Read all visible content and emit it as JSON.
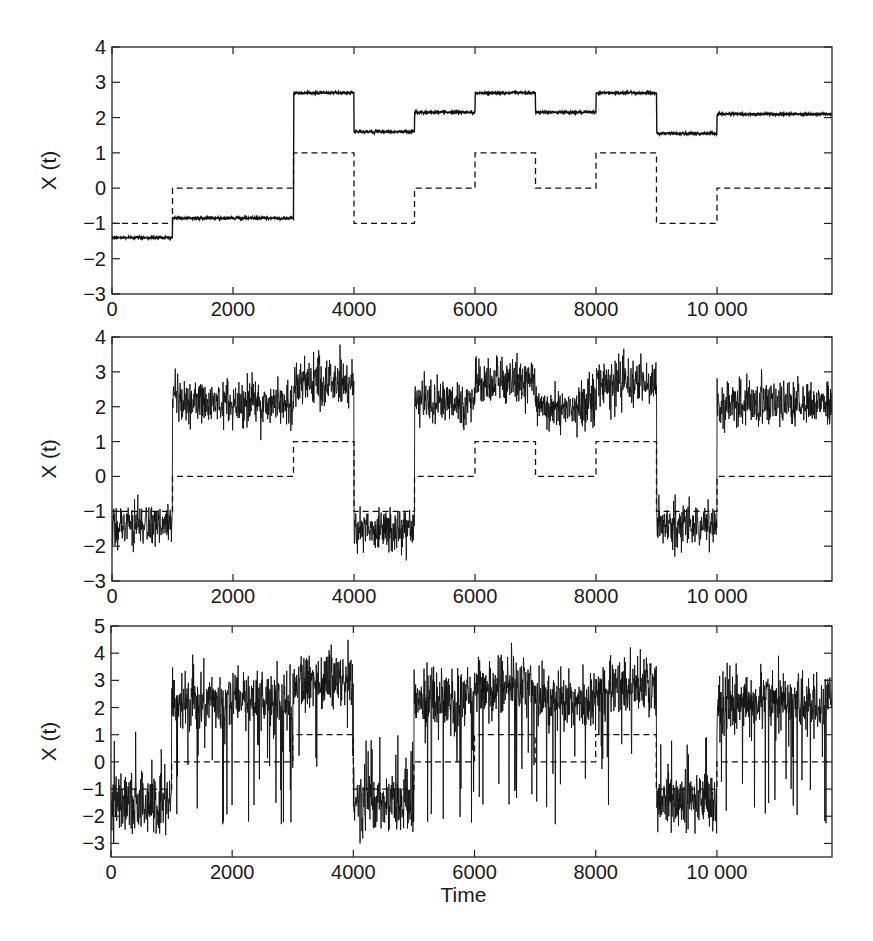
{
  "chart_data": [
    {
      "type": "line",
      "title": "",
      "panel": "top",
      "xlabel": "",
      "ylabel": "X (t)",
      "xlim": [
        0,
        11900
      ],
      "ylim": [
        -3,
        4
      ],
      "xticks": [
        0,
        2000,
        4000,
        6000,
        8000,
        10000
      ],
      "xtick_labels": [
        "0",
        "2000",
        "4000",
        "6000",
        "8000",
        "10 000"
      ],
      "yticks": [
        -3,
        -2,
        -1,
        0,
        1,
        2,
        3,
        4
      ],
      "ytick_labels": [
        "−3",
        "−2",
        "−1",
        "0",
        "1",
        "2",
        "3",
        "4"
      ],
      "grid": false,
      "legend": null,
      "series": [
        {
          "name": "X(t) (solid, noisy)",
          "style": "solid",
          "noise_sd": 0.02,
          "spike_rate": 0,
          "steps": [
            {
              "t0": 0,
              "t1": 1000,
              "y": -1.4
            },
            {
              "t0": 1000,
              "t1": 3000,
              "y": -0.85
            },
            {
              "t0": 3000,
              "t1": 4000,
              "y": 2.7
            },
            {
              "t0": 4000,
              "t1": 5000,
              "y": 1.6
            },
            {
              "t0": 5000,
              "t1": 6000,
              "y": 2.15
            },
            {
              "t0": 6000,
              "t1": 7000,
              "y": 2.7
            },
            {
              "t0": 7000,
              "t1": 8000,
              "y": 2.15
            },
            {
              "t0": 8000,
              "t1": 9000,
              "y": 2.7
            },
            {
              "t0": 9000,
              "t1": 10000,
              "y": 1.55
            },
            {
              "t0": 10000,
              "t1": 11900,
              "y": 2.1
            }
          ]
        },
        {
          "name": "hidden state (dashed)",
          "style": "dashed",
          "steps": [
            {
              "t0": 0,
              "t1": 1000,
              "y": -1
            },
            {
              "t0": 1000,
              "t1": 3000,
              "y": 0
            },
            {
              "t0": 3000,
              "t1": 4000,
              "y": 1
            },
            {
              "t0": 4000,
              "t1": 5000,
              "y": -1
            },
            {
              "t0": 5000,
              "t1": 6000,
              "y": 0
            },
            {
              "t0": 6000,
              "t1": 7000,
              "y": 1
            },
            {
              "t0": 7000,
              "t1": 8000,
              "y": 0
            },
            {
              "t0": 8000,
              "t1": 9000,
              "y": 1
            },
            {
              "t0": 9000,
              "t1": 10000,
              "y": -1
            },
            {
              "t0": 10000,
              "t1": 11900,
              "y": 0
            }
          ]
        }
      ]
    },
    {
      "type": "line",
      "title": "",
      "panel": "middle",
      "xlabel": "",
      "ylabel": "X (t)",
      "xlim": [
        0,
        11900
      ],
      "ylim": [
        -3,
        4
      ],
      "xticks": [
        0,
        2000,
        4000,
        6000,
        8000,
        10000
      ],
      "xtick_labels": [
        "0",
        "2000",
        "4000",
        "6000",
        "8000",
        "10 000"
      ],
      "yticks": [
        -3,
        -2,
        -1,
        0,
        1,
        2,
        3,
        4
      ],
      "ytick_labels": [
        "−3",
        "−2",
        "−1",
        "0",
        "1",
        "2",
        "3",
        "4"
      ],
      "grid": false,
      "legend": null,
      "series": [
        {
          "name": "X(t) (solid, noisy)",
          "style": "solid",
          "noise_sd": 0.33,
          "spike_rate": 0,
          "steps": [
            {
              "t0": 0,
              "t1": 1000,
              "y": -1.4
            },
            {
              "t0": 1000,
              "t1": 3000,
              "y": 2.1
            },
            {
              "t0": 3000,
              "t1": 4000,
              "y": 2.7
            },
            {
              "t0": 4000,
              "t1": 5000,
              "y": -1.5
            },
            {
              "t0": 5000,
              "t1": 6000,
              "y": 2.1
            },
            {
              "t0": 6000,
              "t1": 7000,
              "y": 2.7
            },
            {
              "t0": 7000,
              "t1": 8000,
              "y": 2.0
            },
            {
              "t0": 8000,
              "t1": 9000,
              "y": 2.7
            },
            {
              "t0": 9000,
              "t1": 10000,
              "y": -1.4
            },
            {
              "t0": 10000,
              "t1": 11900,
              "y": 2.1
            }
          ]
        },
        {
          "name": "hidden state (dashed)",
          "style": "dashed",
          "steps": [
            {
              "t0": 0,
              "t1": 1000,
              "y": -1
            },
            {
              "t0": 1000,
              "t1": 3000,
              "y": 0
            },
            {
              "t0": 3000,
              "t1": 4000,
              "y": 1
            },
            {
              "t0": 4000,
              "t1": 5000,
              "y": -1
            },
            {
              "t0": 5000,
              "t1": 6000,
              "y": 0
            },
            {
              "t0": 6000,
              "t1": 7000,
              "y": 1
            },
            {
              "t0": 7000,
              "t1": 8000,
              "y": 0
            },
            {
              "t0": 8000,
              "t1": 9000,
              "y": 1
            },
            {
              "t0": 9000,
              "t1": 10000,
              "y": -1
            },
            {
              "t0": 10000,
              "t1": 11900,
              "y": 0
            }
          ]
        }
      ]
    },
    {
      "type": "line",
      "title": "",
      "panel": "bottom",
      "xlabel": "Time",
      "ylabel": "X (t)",
      "xlim": [
        0,
        11900
      ],
      "ylim": [
        -3.5,
        5
      ],
      "xticks": [
        0,
        2000,
        4000,
        6000,
        8000,
        10000
      ],
      "xtick_labels": [
        "0",
        "2000",
        "4000",
        "6000",
        "8000",
        "10 000"
      ],
      "yticks": [
        -3,
        -2,
        -1,
        0,
        1,
        2,
        3,
        4,
        5
      ],
      "ytick_labels": [
        "−3",
        "−2",
        "−1",
        "0",
        "1",
        "2",
        "3",
        "4",
        "5"
      ],
      "grid": false,
      "legend": null,
      "series": [
        {
          "name": "X(t) (solid, noisy with spikes)",
          "style": "solid",
          "noise_sd": 0.55,
          "spike_rate": 0.012,
          "steps": [
            {
              "t0": 0,
              "t1": 1000,
              "y": -1.5
            },
            {
              "t0": 1000,
              "t1": 3000,
              "y": 2.2
            },
            {
              "t0": 3000,
              "t1": 4000,
              "y": 2.9
            },
            {
              "t0": 4000,
              "t1": 5000,
              "y": -1.6
            },
            {
              "t0": 5000,
              "t1": 6000,
              "y": 2.2
            },
            {
              "t0": 6000,
              "t1": 7000,
              "y": 2.8
            },
            {
              "t0": 7000,
              "t1": 8000,
              "y": 2.2
            },
            {
              "t0": 8000,
              "t1": 9000,
              "y": 2.8
            },
            {
              "t0": 9000,
              "t1": 10000,
              "y": -1.5
            },
            {
              "t0": 10000,
              "t1": 11900,
              "y": 2.2
            }
          ]
        },
        {
          "name": "hidden state (dashed)",
          "style": "dashed",
          "steps": [
            {
              "t0": 0,
              "t1": 1000,
              "y": -1
            },
            {
              "t0": 1000,
              "t1": 3000,
              "y": 0
            },
            {
              "t0": 3000,
              "t1": 4000,
              "y": 1
            },
            {
              "t0": 4000,
              "t1": 5000,
              "y": -1
            },
            {
              "t0": 5000,
              "t1": 6000,
              "y": 0
            },
            {
              "t0": 6000,
              "t1": 7000,
              "y": 1
            },
            {
              "t0": 7000,
              "t1": 8000,
              "y": 0
            },
            {
              "t0": 8000,
              "t1": 9000,
              "y": 1
            },
            {
              "t0": 9000,
              "t1": 10000,
              "y": -1
            },
            {
              "t0": 10000,
              "t1": 11900,
              "y": 0
            }
          ]
        }
      ]
    }
  ],
  "layout": {
    "panels": [
      {
        "left": 112,
        "top": 47,
        "right": 832,
        "bottom": 294
      },
      {
        "left": 112,
        "top": 337,
        "right": 832,
        "bottom": 581
      },
      {
        "left": 111,
        "top": 626,
        "right": 832,
        "bottom": 857
      }
    ],
    "line_color": "#111111",
    "axis_color": "#222222"
  }
}
